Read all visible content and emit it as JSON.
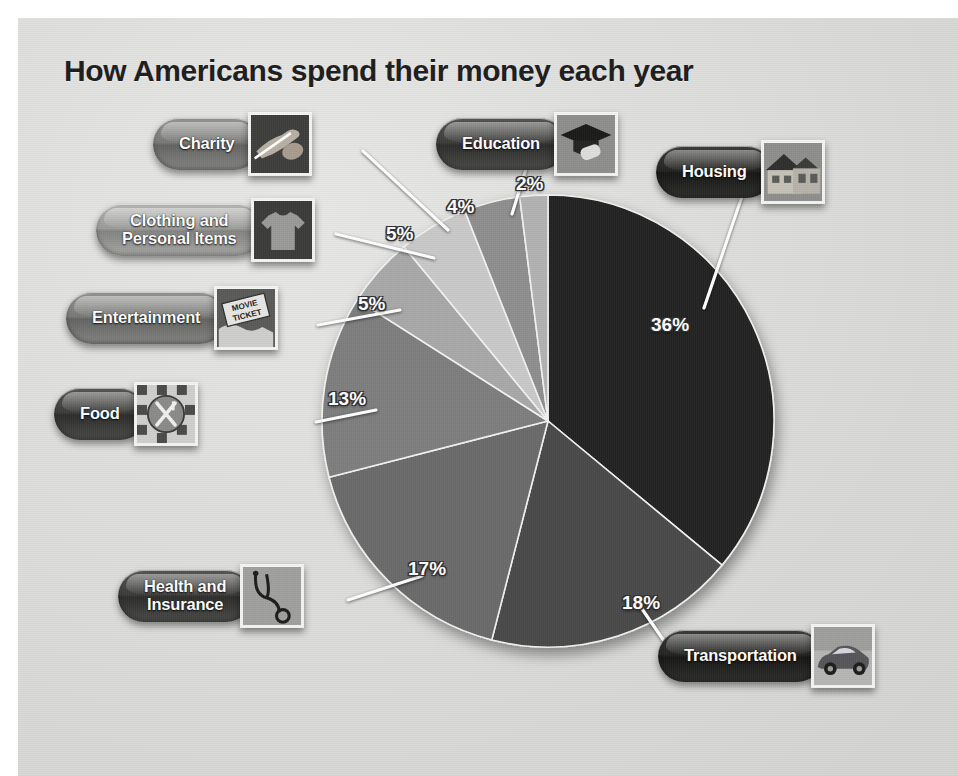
{
  "poster": {
    "title": "How Americans spend their money each year",
    "background_color": "#dededc"
  },
  "chart_data": {
    "type": "pie",
    "title": "How Americans spend their money each year",
    "xlabel": "",
    "ylabel": "",
    "unit": "percent",
    "total": 100,
    "legend_position": "callout-labels",
    "grid": false,
    "start_angle_deg": 0,
    "direction": "clockwise",
    "categories": [
      "Housing",
      "Transportation",
      "Health and Insurance",
      "Food",
      "Entertainment",
      "Clothing and Personal Items",
      "Charity",
      "Education"
    ],
    "values": [
      36,
      18,
      17,
      13,
      5,
      5,
      4,
      2
    ],
    "labels": [
      "36%",
      "18%",
      "17%",
      "13%",
      "5%",
      "5%",
      "4%",
      "2%"
    ],
    "colors": [
      "#232323",
      "#4a4a4a",
      "#6a6a6a",
      "#7e7e7e",
      "#a8a8a8",
      "#c9c9c9",
      "#8e8e8e",
      "#b2b2b2"
    ],
    "slices": [
      {
        "name": "Housing",
        "value": 36,
        "label": "36%",
        "color": "#232323",
        "icon": "house-icon"
      },
      {
        "name": "Transportation",
        "value": 18,
        "label": "18%",
        "color": "#4a4a4a",
        "icon": "car-icon"
      },
      {
        "name": "Health and Insurance",
        "value": 17,
        "label": "17%",
        "color": "#6a6a6a",
        "icon": "stethoscope-icon"
      },
      {
        "name": "Food",
        "value": 13,
        "label": "13%",
        "color": "#7e7e7e",
        "icon": "plate-fork-knife-icon"
      },
      {
        "name": "Entertainment",
        "value": 5,
        "label": "5%",
        "color": "#a8a8a8",
        "icon": "movie-ticket-icon"
      },
      {
        "name": "Clothing and Personal Items",
        "value": 5,
        "label": "5%",
        "color": "#c9c9c9",
        "icon": "tshirt-icon"
      },
      {
        "name": "Charity",
        "value": 4,
        "label": "4%",
        "color": "#8e8e8e",
        "icon": "helping-hands-icon"
      },
      {
        "name": "Education",
        "value": 2,
        "label": "2%",
        "color": "#b2b2b2",
        "icon": "graduation-cap-icon"
      }
    ]
  },
  "labels": {
    "charity": {
      "text": "Charity",
      "percent": "4%",
      "icon": "helping-hands-icon"
    },
    "clothing": {
      "text": "Clothing and\nPersonal Items",
      "percent": "5%",
      "icon": "tshirt-icon"
    },
    "entertainment": {
      "text": "Entertainment",
      "percent": "5%",
      "icon": "movie-ticket-icon"
    },
    "food": {
      "text": "Food",
      "percent": "13%",
      "icon": "plate-fork-knife-icon"
    },
    "health": {
      "text": "Health and\nInsurance",
      "percent": "17%",
      "icon": "stethoscope-icon"
    },
    "education": {
      "text": "Education",
      "percent": "2%",
      "icon": "graduation-cap-icon"
    },
    "housing": {
      "text": "Housing",
      "percent": "36%",
      "icon": "house-icon"
    },
    "transportation": {
      "text": "Transportation",
      "percent": "18%",
      "icon": "car-icon"
    }
  },
  "thumbnail_captions": {
    "movie_ticket_line1": "MOVIE",
    "movie_ticket_line2": "TICKET"
  }
}
